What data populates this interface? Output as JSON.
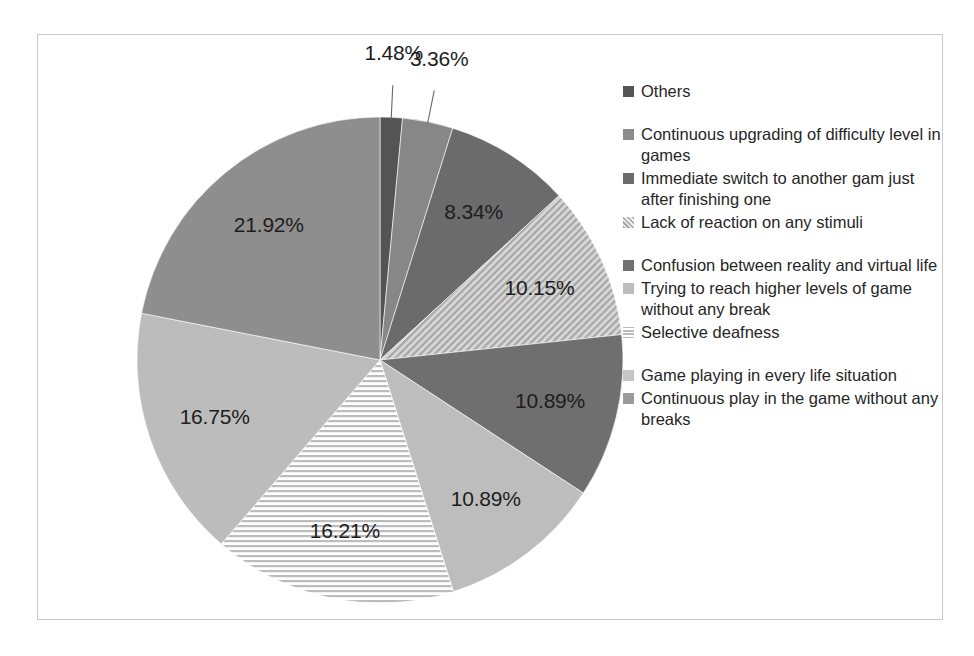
{
  "chart_data": {
    "type": "pie",
    "title": "",
    "subtitle": "",
    "xlabel": "",
    "ylabel": "",
    "legend_position": "right",
    "grid": false,
    "unit": "%",
    "start_angle_deg": 0,
    "direction": "clockwise",
    "categories": [
      "Others",
      "Continuous upgrading of difficulty level in games",
      "Immediate switch to another gam just after finishing one",
      "Lack of reaction on any stimuli",
      "Confusion between reality and virtual life",
      "Trying to reach higher levels of game without any break",
      "Selective deafness",
      "Game playing in every life situation",
      "Continuous play in the game without any breaks"
    ],
    "values": [
      1.48,
      3.36,
      8.34,
      10.15,
      10.89,
      10.89,
      16.21,
      16.75,
      21.92
    ],
    "labels": [
      "1.48%",
      "3.36%",
      "8.34%",
      "10.15%",
      "10.89%",
      "10.89%",
      "16.21%",
      "16.75%",
      "21.92%"
    ],
    "slices": [
      {
        "label": "1.48%",
        "value": 1.48,
        "category": "Others",
        "fill": "#545454",
        "pattern": "solid",
        "leader": true
      },
      {
        "label": "3.36%",
        "value": 3.36,
        "category": "Continuous upgrading of difficulty level in games",
        "fill": "#878787",
        "pattern": "solid",
        "leader": true
      },
      {
        "label": "8.34%",
        "value": 8.34,
        "category": "Immediate switch to another gam just after finishing one",
        "fill": "#6b6b6b",
        "pattern": "solid",
        "leader": false
      },
      {
        "label": "10.15%",
        "value": 10.15,
        "category": "Lack of reaction on any stimuli",
        "fill": "#c8c8c8",
        "pattern": "diagonal-hatch",
        "leader": false
      },
      {
        "label": "10.89%",
        "value": 10.89,
        "category": "Confusion between reality and virtual life",
        "fill": "#6f6f6f",
        "pattern": "solid",
        "leader": false
      },
      {
        "label": "10.89%",
        "value": 10.89,
        "category": "Trying to reach higher levels of game without any break",
        "fill": "#bdbdbd",
        "pattern": "solid",
        "leader": false
      },
      {
        "label": "16.21%",
        "value": 16.21,
        "category": "Selective deafness",
        "fill": "#d6d6d6",
        "pattern": "horizontal-hatch",
        "leader": false
      },
      {
        "label": "16.75%",
        "value": 16.75,
        "category": "Game playing in every life situation",
        "fill": "#bcbcbc",
        "pattern": "solid",
        "leader": false
      },
      {
        "label": "21.92%",
        "value": 21.92,
        "category": "Continuous play in the game without any breaks",
        "fill": "#8e8e8e",
        "pattern": "solid",
        "leader": false
      }
    ]
  },
  "legend": {
    "items": [
      {
        "label": "Others",
        "swatch": "#545454",
        "pattern": "solid",
        "gap_before": false
      },
      {
        "label": "Continuous upgrading of difficulty level in games",
        "swatch": "#8b8b8b",
        "pattern": "solid",
        "gap_before": true
      },
      {
        "label": "Immediate switch to another gam just after finishing one",
        "swatch": "#6b6b6b",
        "pattern": "solid",
        "gap_before": false
      },
      {
        "label": "Lack of reaction on any stimuli",
        "swatch": "#cfcfcf",
        "pattern": "diagonal-hatch",
        "gap_before": false
      },
      {
        "label": "Confusion between reality and virtual life",
        "swatch": "#717171",
        "pattern": "solid",
        "gap_before": true
      },
      {
        "label": "Trying to reach higher levels of game without any break",
        "swatch": "#bdbdbd",
        "pattern": "solid",
        "gap_before": false
      },
      {
        "label": "Selective deafness",
        "swatch": "#dadada",
        "pattern": "horizontal-hatch",
        "gap_before": false
      },
      {
        "label": "Game playing in every life situation",
        "swatch": "#c6c6c6",
        "pattern": "solid",
        "gap_before": true
      },
      {
        "label": "Continuous play in the game without any breaks",
        "swatch": "#9a9a9a",
        "pattern": "solid",
        "gap_before": false
      }
    ]
  },
  "style": {
    "frame_border_color": "#c9c9c9",
    "background": "#ffffff",
    "label_color": "#1d1d1d",
    "legend_text_color": "#262626"
  },
  "geometry": {
    "center_x": 342,
    "center_y": 325,
    "radius": 243
  }
}
